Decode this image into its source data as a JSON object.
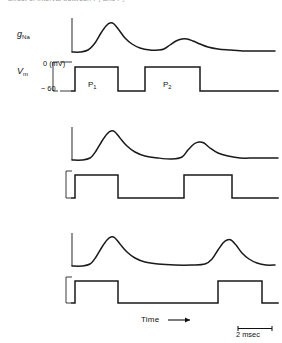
{
  "figure": {
    "cut_off_caption_top": "Effect of interval between P₁ and P₂",
    "axis_labels": {
      "conductance": "g",
      "conductance_subscript": "Na",
      "voltage": "V",
      "voltage_subscript": "m"
    },
    "voltage_ticks": {
      "top": "0 (mV)",
      "bottom": "− 60"
    },
    "pulse_labels": {
      "first": "P",
      "first_subscript": "1",
      "second": "P",
      "second_subscript": "2"
    },
    "time_axis_label": "Time",
    "time_axis_arrow": "→",
    "scale_bar_label": "2 msec",
    "colors": {
      "trace": "#1a1a1a",
      "axis": "#3a3a3a",
      "text": "#111111",
      "background": "#ffffff"
    }
  },
  "chart_data": {
    "type": "line",
    "xlabel": "Time",
    "ylabel": "g_Na / V_m",
    "x_units": "msec",
    "scale_bar_msec": 2,
    "voltage_levels_mv": {
      "holding": -60,
      "test": 0
    },
    "panels": [
      {
        "panel": 1,
        "interpulse_interval_msec": 1.2,
        "p1_onset_px": 75,
        "p1_offset_px": 118,
        "p2_onset_px": 145,
        "p2_offset_px": 200,
        "conductance_peak_1_relative": 1.0,
        "conductance_peak_2_relative": 0.3,
        "recovery_fraction": 0.3,
        "gna_trace": [
          [
            72,
            52
          ],
          [
            80,
            52
          ],
          [
            88,
            50
          ],
          [
            95,
            43
          ],
          [
            101,
            33
          ],
          [
            106,
            26
          ],
          [
            110,
            23
          ],
          [
            114,
            24
          ],
          [
            119,
            30
          ],
          [
            125,
            38
          ],
          [
            132,
            44
          ],
          [
            140,
            48
          ],
          [
            150,
            50
          ],
          [
            158,
            50
          ],
          [
            164,
            49
          ],
          [
            170,
            45
          ],
          [
            176,
            41
          ],
          [
            182,
            39
          ],
          [
            187,
            39
          ],
          [
            193,
            41
          ],
          [
            200,
            44
          ],
          [
            208,
            47
          ],
          [
            218,
            49
          ],
          [
            230,
            50
          ],
          [
            245,
            51
          ],
          [
            260,
            51
          ],
          [
            275,
            51
          ]
        ],
        "vm_trace": [
          [
            72,
            91
          ],
          [
            75,
            91
          ],
          [
            75,
            67
          ],
          [
            118,
            67
          ],
          [
            118,
            91
          ],
          [
            145,
            91
          ],
          [
            145,
            67
          ],
          [
            200,
            67
          ],
          [
            200,
            91
          ],
          [
            278,
            91
          ]
        ]
      },
      {
        "panel": 2,
        "interpulse_interval_msec": 2.6,
        "p1_onset_px": 75,
        "p1_offset_px": 118,
        "p2_onset_px": 184,
        "p2_offset_px": 232,
        "conductance_peak_1_relative": 1.0,
        "conductance_peak_2_relative": 0.55,
        "recovery_fraction": 0.55,
        "gna_trace": [
          [
            72,
            160
          ],
          [
            82,
            160
          ],
          [
            90,
            158
          ],
          [
            96,
            151
          ],
          [
            102,
            141
          ],
          [
            107,
            134
          ],
          [
            111,
            131
          ],
          [
            115,
            132
          ],
          [
            120,
            138
          ],
          [
            127,
            146
          ],
          [
            135,
            152
          ],
          [
            145,
            156
          ],
          [
            158,
            158
          ],
          [
            172,
            159
          ],
          [
            182,
            157
          ],
          [
            188,
            150
          ],
          [
            194,
            144
          ],
          [
            199,
            142
          ],
          [
            204,
            143
          ],
          [
            210,
            148
          ],
          [
            218,
            153
          ],
          [
            228,
            156
          ],
          [
            240,
            158
          ],
          [
            255,
            158
          ],
          [
            270,
            158
          ],
          [
            278,
            158
          ]
        ],
        "vm_trace": [
          [
            72,
            198
          ],
          [
            75,
            198
          ],
          [
            75,
            175
          ],
          [
            118,
            175
          ],
          [
            118,
            198
          ],
          [
            184,
            198
          ],
          [
            184,
            175
          ],
          [
            232,
            175
          ],
          [
            232,
            198
          ],
          [
            278,
            198
          ]
        ]
      },
      {
        "panel": 3,
        "interpulse_interval_msec": 5.4,
        "p1_onset_px": 75,
        "p1_offset_px": 118,
        "p2_onset_px": 218,
        "p2_offset_px": 262,
        "conductance_peak_1_relative": 1.0,
        "conductance_peak_2_relative": 0.95,
        "recovery_fraction": 0.95,
        "gna_trace": [
          [
            72,
            266
          ],
          [
            82,
            266
          ],
          [
            90,
            264
          ],
          [
            96,
            257
          ],
          [
            102,
            247
          ],
          [
            107,
            240
          ],
          [
            111,
            237
          ],
          [
            115,
            238
          ],
          [
            120,
            244
          ],
          [
            127,
            252
          ],
          [
            135,
            258
          ],
          [
            145,
            262
          ],
          [
            158,
            264
          ],
          [
            175,
            265
          ],
          [
            192,
            265
          ],
          [
            205,
            264
          ],
          [
            212,
            259
          ],
          [
            218,
            250
          ],
          [
            223,
            243
          ],
          [
            227,
            240
          ],
          [
            231,
            240
          ],
          [
            236,
            245
          ],
          [
            242,
            253
          ],
          [
            249,
            259
          ],
          [
            257,
            263
          ],
          [
            266,
            265
          ],
          [
            275,
            265
          ]
        ],
        "vm_trace": [
          [
            72,
            303
          ],
          [
            75,
            303
          ],
          [
            75,
            281
          ],
          [
            118,
            281
          ],
          [
            118,
            303
          ],
          [
            218,
            303
          ],
          [
            218,
            281
          ],
          [
            262,
            281
          ],
          [
            262,
            303
          ],
          [
            278,
            303
          ]
        ]
      }
    ],
    "legend": [],
    "grid": false,
    "annotations": [
      "P₁ = conditioning pulse",
      "P₂ = test pulse",
      "Second response grows as interpulse interval lengthens"
    ]
  }
}
